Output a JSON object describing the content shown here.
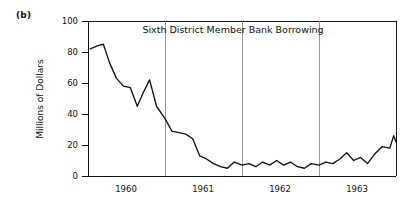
{
  "figure": {
    "panel_label": "(b)"
  },
  "chart_data": {
    "type": "line",
    "title": "Sixth District Member Bank Borrowing",
    "xlabel": "",
    "ylabel": "Millions of Dollars",
    "ylim": [
      0,
      100
    ],
    "yticks": [
      0,
      20,
      40,
      60,
      80,
      100
    ],
    "ytick_labels": [
      "0",
      "20",
      "40",
      "60",
      "80",
      "100"
    ],
    "xtick_labels": [
      "1960",
      "1961",
      "1962",
      "1963"
    ],
    "xtick_positions": [
      0.5,
      1.5,
      2.5,
      3.5
    ],
    "grid": "vertical-year-boundaries",
    "gridline_positions": [
      1.0,
      2.0,
      3.0
    ],
    "xlim": [
      0.0,
      4.0
    ],
    "legend": "none",
    "series": [
      {
        "name": "Sixth District Member Bank Borrowing",
        "x": [
          0.03,
          0.12,
          0.2,
          0.28,
          0.37,
          0.46,
          0.55,
          0.64,
          0.72,
          0.8,
          0.89,
          1.0,
          1.09,
          1.18,
          1.27,
          1.36,
          1.45,
          1.54,
          1.63,
          1.72,
          1.81,
          1.9,
          2.0,
          2.09,
          2.18,
          2.27,
          2.36,
          2.45,
          2.54,
          2.63,
          2.72,
          2.81,
          2.9,
          3.0,
          3.09,
          3.18,
          3.27,
          3.36,
          3.45,
          3.54,
          3.63,
          3.72,
          3.82,
          3.92
        ],
        "values": [
          82,
          84,
          85,
          73,
          63,
          58,
          57,
          45,
          54,
          62,
          45,
          37,
          29,
          28,
          27,
          24,
          13,
          11,
          8,
          6,
          5,
          9,
          7,
          8,
          6,
          9,
          7,
          10,
          7,
          9,
          6,
          5,
          8,
          7,
          9,
          8,
          11,
          15,
          10,
          12,
          8,
          14,
          19,
          18
        ],
        "extra_x": [
          3.97,
          4.0
        ],
        "extra_values": [
          26,
          22
        ]
      }
    ]
  }
}
